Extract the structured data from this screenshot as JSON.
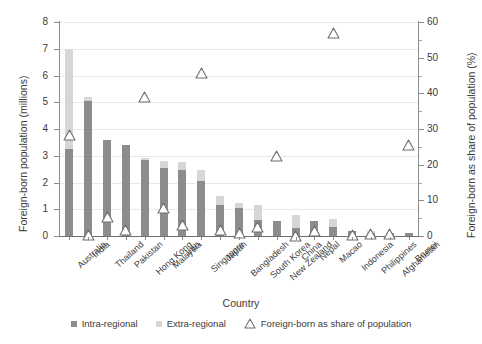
{
  "chart_data": {
    "type": "bar",
    "title": "",
    "subtitle": "",
    "xlabel": "Country",
    "ylabel": "Foreign-born population (millions)",
    "ylabel_secondary": "Foreign-born as share of population (%)",
    "ylim": [
      0,
      8
    ],
    "ylim_secondary": [
      0,
      60
    ],
    "yticks": [
      0,
      1,
      2,
      3,
      4,
      5,
      6,
      7,
      8
    ],
    "yticks_secondary": [
      0,
      10,
      20,
      30,
      40,
      50,
      60
    ],
    "grid": true,
    "legend_position": "bottom",
    "categories": [
      "Australia",
      "India",
      "Thailand",
      "Pakistan",
      "Hong Kong",
      "Malaysia",
      "Iran",
      "Singapore",
      "Japan",
      "Bangladesh",
      "South Korea",
      "New Zealand",
      "China",
      "Nepal",
      "Macao",
      "Indonesia",
      "Philippines",
      "Afghanistan",
      "Brunei"
    ],
    "series": [
      {
        "name": "Intra-regional",
        "color": "#8c8c8c",
        "values": [
          3.25,
          5.05,
          3.6,
          3.4,
          2.85,
          2.55,
          2.45,
          2.05,
          1.15,
          1.05,
          0.6,
          0.55,
          0.3,
          0.55,
          0.35,
          0.2,
          0.12,
          0.1,
          0.1
        ]
      },
      {
        "name": "Extra-regional",
        "color": "#d6d6d6",
        "values": [
          3.75,
          0.15,
          0.0,
          0.0,
          0.05,
          0.25,
          0.3,
          0.4,
          0.35,
          0.2,
          0.55,
          0.0,
          0.5,
          0.0,
          0.3,
          0.0,
          0.08,
          0.0,
          0.0
        ]
      }
    ],
    "marker_series": {
      "name": "Foreign-born as share of population",
      "axis": "secondary",
      "marker": "triangle-up",
      "color": "#6f6f6f",
      "values": [
        28.2,
        0.4,
        5.2,
        1.6,
        39.0,
        7.8,
        3.2,
        45.8,
        1.6,
        0.8,
        2.6,
        22.5,
        0.1,
        1.4,
        57.0,
        0.2,
        0.5,
        0.5,
        25.4
      ]
    }
  },
  "legend": {
    "items": [
      {
        "label": "Intra-regional",
        "glyph": "square-swatch",
        "color": "#8c8c8c"
      },
      {
        "label": "Extra-regional",
        "glyph": "square-swatch",
        "color": "#d6d6d6"
      },
      {
        "label": "Foreign-born as share of population",
        "glyph": "triangle-up-icon",
        "color": "#6f6f6f"
      }
    ]
  }
}
